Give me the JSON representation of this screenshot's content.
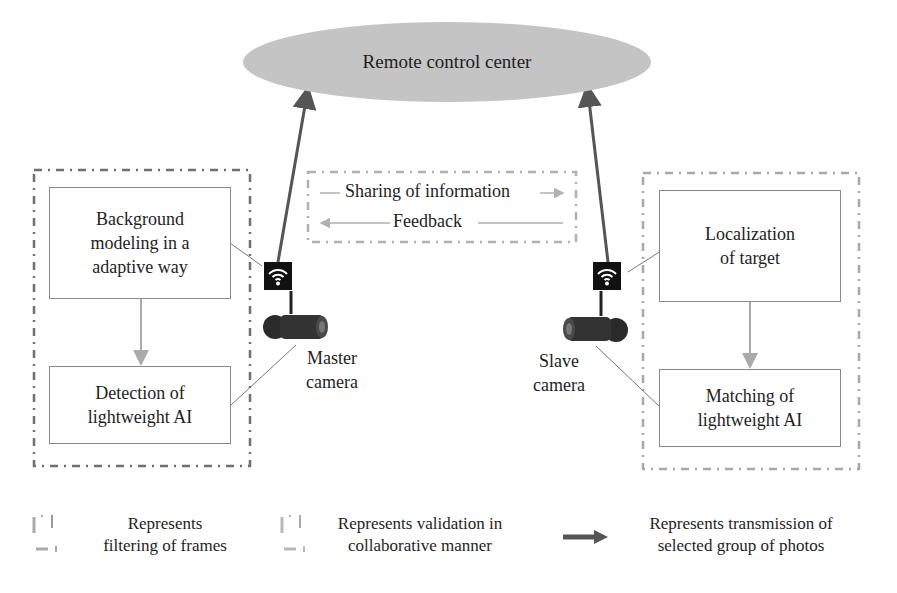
{
  "diagram": {
    "center": {
      "label": "Remote control center"
    },
    "left_group": {
      "type": "filtering of frames",
      "boxes": [
        {
          "label": "Background\nmodeling in a\nadaptive way"
        },
        {
          "label": "Detection of\nlightweight AI"
        }
      ],
      "camera_label": "Master\ncamera"
    },
    "right_group": {
      "type": "validation in collaborative manner",
      "boxes": [
        {
          "label": "Localization\nof target"
        },
        {
          "label": "Matching of\nlightweight AI"
        }
      ],
      "camera_label": "Slave\ncamera"
    },
    "sharing": {
      "forward_label": "Sharing of information",
      "backward_label": "Feedback"
    },
    "icons": {
      "wifi": "wifi-icon",
      "camera": "camera-icon"
    },
    "colors": {
      "ellipse_fill": "#c4c4c4",
      "main_arrow": "#555555",
      "left_border": "#6f6f6f",
      "right_border": "#a8a8a8",
      "box_border": "#8a8a8a",
      "inner_arrow": "#a8a8a8"
    }
  },
  "legend": [
    {
      "icon": "dash-dot-box-dark",
      "text": "Represents\nfiltering of frames"
    },
    {
      "icon": "dash-dot-box-light",
      "text": "Represents validation in\ncollaborative manner"
    },
    {
      "icon": "thick-arrow",
      "text": "Represents transmission of\nselected group of photos"
    }
  ]
}
